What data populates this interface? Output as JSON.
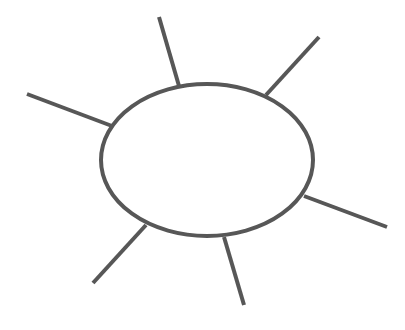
{
  "diagram": {
    "type": "spider-map-template",
    "stroke_color": "#575757",
    "background": "#ffffff",
    "center": {
      "shape": "ellipse",
      "cx": 207,
      "cy": 160,
      "rx": 106,
      "ry": 76,
      "label": ""
    },
    "spokes": [
      {
        "id": "top",
        "x1": 179,
        "y1": 86,
        "x2": 159,
        "y2": 17,
        "label": ""
      },
      {
        "id": "top-right",
        "x1": 266,
        "y1": 95,
        "x2": 319,
        "y2": 37,
        "label": ""
      },
      {
        "id": "left",
        "x1": 112,
        "y1": 126,
        "x2": 27,
        "y2": 94,
        "label": ""
      },
      {
        "id": "right",
        "x1": 304,
        "y1": 196,
        "x2": 387,
        "y2": 227,
        "label": ""
      },
      {
        "id": "bottom-left",
        "x1": 146,
        "y1": 225,
        "x2": 93,
        "y2": 283,
        "label": ""
      },
      {
        "id": "bottom",
        "x1": 224,
        "y1": 237,
        "x2": 244,
        "y2": 305,
        "label": ""
      }
    ]
  }
}
